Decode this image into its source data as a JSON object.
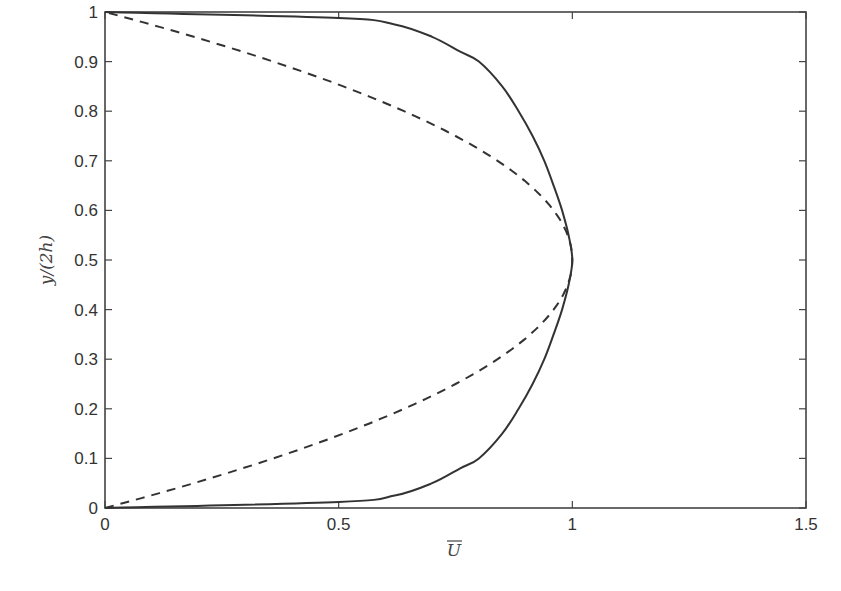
{
  "chart_data": {
    "type": "line",
    "title": "",
    "xlabel": "U̅",
    "ylabel": "y/(2h)",
    "xlim": [
      0,
      1.5
    ],
    "ylim": [
      0,
      1
    ],
    "grid": false,
    "legend": null,
    "xticks": [
      "0",
      "0.5",
      "1",
      "1.5"
    ],
    "yticks": [
      "0",
      "0.1",
      "0.2",
      "0.3",
      "0.4",
      "0.5",
      "0.6",
      "0.7",
      "0.8",
      "0.9",
      "1"
    ],
    "series": [
      {
        "name": "turbulent profile",
        "style": "solid",
        "points": [
          [
            0,
            0
          ],
          [
            0.5,
            0.012
          ],
          [
            0.62,
            0.025
          ],
          [
            0.7,
            0.05
          ],
          [
            0.76,
            0.08
          ],
          [
            0.8,
            0.1
          ],
          [
            0.85,
            0.15
          ],
          [
            0.885,
            0.2
          ],
          [
            0.915,
            0.25
          ],
          [
            0.94,
            0.3
          ],
          [
            0.96,
            0.35
          ],
          [
            0.978,
            0.4
          ],
          [
            0.992,
            0.45
          ],
          [
            1.0,
            0.5
          ],
          [
            0.992,
            0.55
          ],
          [
            0.978,
            0.6
          ],
          [
            0.96,
            0.65
          ],
          [
            0.94,
            0.7
          ],
          [
            0.915,
            0.75
          ],
          [
            0.885,
            0.8
          ],
          [
            0.85,
            0.85
          ],
          [
            0.8,
            0.9
          ],
          [
            0.76,
            0.92
          ],
          [
            0.7,
            0.95
          ],
          [
            0.62,
            0.975
          ],
          [
            0.5,
            0.988
          ],
          [
            0,
            1
          ]
        ]
      },
      {
        "name": "laminar profile",
        "style": "dashed",
        "formula": "U = 4*y*(1-y)",
        "points": [
          [
            0,
            0
          ],
          [
            0.19,
            0.05
          ],
          [
            0.36,
            0.1
          ],
          [
            0.51,
            0.15
          ],
          [
            0.64,
            0.2
          ],
          [
            0.75,
            0.25
          ],
          [
            0.84,
            0.3
          ],
          [
            0.91,
            0.35
          ],
          [
            0.96,
            0.4
          ],
          [
            0.99,
            0.45
          ],
          [
            1.0,
            0.5
          ],
          [
            0.99,
            0.55
          ],
          [
            0.96,
            0.6
          ],
          [
            0.91,
            0.65
          ],
          [
            0.84,
            0.7
          ],
          [
            0.75,
            0.75
          ],
          [
            0.64,
            0.8
          ],
          [
            0.51,
            0.85
          ],
          [
            0.36,
            0.9
          ],
          [
            0.19,
            0.95
          ],
          [
            0,
            1
          ]
        ]
      }
    ]
  },
  "plot": {
    "ylabel_text": "y/(2h)",
    "xlabel_text": "U",
    "line_color": "#333333"
  }
}
